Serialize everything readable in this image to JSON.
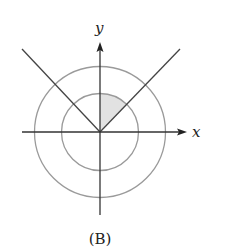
{
  "figure": {
    "caption": "(B)",
    "axes": {
      "x_label": "x",
      "y_label": "y"
    },
    "circles": [
      {
        "name": "inner",
        "radius_px": 38.5
      },
      {
        "name": "outer",
        "radius_px": 65.5
      }
    ],
    "lines": [
      {
        "name": "y = x",
        "angle_deg": 45
      },
      {
        "name": "y = -x",
        "angle_deg": 135
      }
    ],
    "shaded_region": {
      "description": "sector of inner circle between line y = x and positive y-axis",
      "from_angle_deg": 45,
      "to_angle_deg": 90
    },
    "colors": {
      "axes": "#333333",
      "circles": "#9a9a9a",
      "lines": "#444444",
      "shade": "#e2e2e2"
    }
  }
}
